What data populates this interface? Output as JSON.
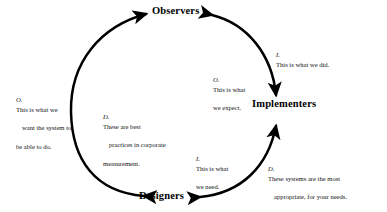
{
  "diagram": {
    "type": "cycle",
    "title": "",
    "nodes": [
      {
        "id": "observers",
        "label": "Observers",
        "position": "top"
      },
      {
        "id": "implementers",
        "label": "Implementers",
        "position": "right"
      },
      {
        "id": "designers",
        "label": "Designers",
        "position": "bottom"
      }
    ],
    "edges": [
      {
        "id": "designers-to-observers",
        "from": "designers",
        "to": "observers",
        "side": "left",
        "bidirectional": true,
        "labels": [
          "label-o-want",
          "label-d-best"
        ]
      },
      {
        "id": "observers-to-implementers",
        "from": "observers",
        "to": "implementers",
        "side": "top-right",
        "bidirectional": true,
        "labels": [
          "label-i-did",
          "label-o-expect"
        ]
      },
      {
        "id": "designers-to-implementers",
        "from": "designers",
        "to": "implementers",
        "side": "bottom-right",
        "bidirectional": true,
        "labels": [
          "label-i-need",
          "label-d-systems"
        ]
      }
    ],
    "edge_labels": {
      "o_want": {
        "tag": "O.",
        "line1": "This is what we",
        "line2": "want the system to",
        "line3": "be able to do."
      },
      "d_best": {
        "tag": "D.",
        "line1": "These are best",
        "line2": "practices in corporate",
        "line3": "measurement."
      },
      "i_did": {
        "tag": "I.",
        "line1": "This is what we did.",
        "line2": "",
        "line3": ""
      },
      "o_expect": {
        "tag": "O.",
        "line1": "This is what",
        "line2": "we expect.",
        "line3": ""
      },
      "i_need": {
        "tag": "I.",
        "line1": "This is what",
        "line2": "we need.",
        "line3": ""
      },
      "d_systems": {
        "tag": "D.",
        "line1": "These systems are the most",
        "line2": "appropriate, for your needs.",
        "line3": ""
      }
    },
    "legend_keys": {
      "O": "Observers",
      "I": "Implementers",
      "D": "Designers"
    },
    "colors": {
      "stroke": "#000000",
      "text": "#111111",
      "node_text": "#000000",
      "background": "#ffffff"
    }
  }
}
